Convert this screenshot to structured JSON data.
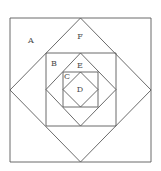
{
  "diagram": {
    "type": "nested-squares",
    "stroke_color": "#5a5a5a",
    "shapes": [
      {
        "id": "outer-square",
        "kind": "square",
        "points": "10,18 151,18 151,162 10,162"
      },
      {
        "id": "diamond-1",
        "kind": "diamond",
        "points": "80.5,18 151,90 80.5,162 10,90"
      },
      {
        "id": "square-2",
        "kind": "square",
        "points": "46,53 116,53 116,126 46,126"
      },
      {
        "id": "diamond-2",
        "kind": "diamond",
        "points": "80.5,53 116,89.5 80.5,126 46,89.5"
      },
      {
        "id": "square-3",
        "kind": "square",
        "points": "63,72 98,72 98,107 63,107"
      },
      {
        "id": "diamond-3",
        "kind": "diamond",
        "points": "80.5,72 98,89.5 80.5,107 63,89.5"
      }
    ],
    "labels": [
      {
        "id": "A",
        "text": "A",
        "x": 31,
        "y": 41
      },
      {
        "id": "F",
        "text": "F",
        "x": 80,
        "y": 37
      },
      {
        "id": "B",
        "text": "B",
        "x": 54,
        "y": 64
      },
      {
        "id": "E",
        "text": "E",
        "x": 80,
        "y": 66
      },
      {
        "id": "C",
        "text": "C",
        "x": 67,
        "y": 77
      },
      {
        "id": "D",
        "text": "D",
        "x": 80,
        "y": 90
      }
    ]
  }
}
